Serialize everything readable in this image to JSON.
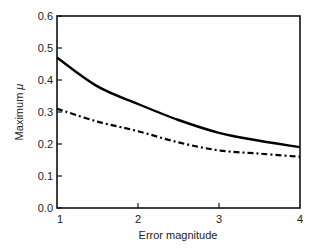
{
  "chart_data": {
    "type": "line",
    "title": "",
    "xlabel": "Error magnitude",
    "ylabel": "Maximum μ",
    "xlim": [
      1,
      4
    ],
    "ylim": [
      0.0,
      0.6
    ],
    "xticks": [
      "1",
      "2",
      "3",
      "4"
    ],
    "yticks": [
      "0.0",
      "0.1",
      "0.2",
      "0.3",
      "0.4",
      "0.5",
      "0.6"
    ],
    "grid": false,
    "legend": null,
    "x": [
      1.0,
      1.5,
      2.0,
      2.5,
      3.0,
      3.5,
      4.0
    ],
    "series": [
      {
        "name": "solid",
        "style": "solid",
        "values": [
          0.47,
          0.38,
          0.325,
          0.275,
          0.235,
          0.21,
          0.19
        ]
      },
      {
        "name": "dash-dot",
        "style": "dash-dot",
        "values": [
          0.31,
          0.27,
          0.24,
          0.205,
          0.18,
          0.17,
          0.16
        ]
      }
    ]
  },
  "axes": {
    "xlabel": "Error magnitude",
    "ylabel_text": "Maximum ",
    "ylabel_symbol": "μ",
    "xticks": [
      "1",
      "2",
      "3",
      "4"
    ],
    "yticks": [
      "0.0",
      "0.1",
      "0.2",
      "0.3",
      "0.4",
      "0.5",
      "0.6"
    ]
  }
}
